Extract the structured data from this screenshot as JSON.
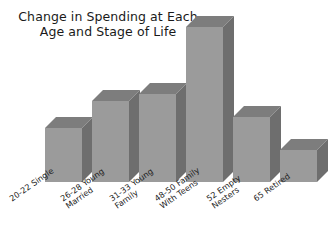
{
  "chart_data": {
    "type": "bar",
    "title": "Change in Spending at Each\nAge and Stage of Life",
    "xlabel": "",
    "ylabel": "",
    "categories": [
      "20-22 Single",
      "26-28 Young\nMarried",
      "31-33 Young\nFamily",
      "48-50 Family\nWith Teens",
      "52 Empty\nNesters",
      "65 Retired"
    ],
    "values": [
      32,
      48,
      52,
      98,
      44,
      19
    ],
    "ylim": [
      0,
      100
    ],
    "grid": false,
    "legend": "none",
    "style": "3d-column",
    "colors": {
      "bar_front": "#9b9b9b",
      "bar_top": "#7d7d7d",
      "bar_side": "#6e6e6e",
      "background": "#ffffff",
      "text": "#1a1a1a"
    }
  },
  "bars": [
    {
      "label": "20-22 Single",
      "left": 45,
      "width": 37,
      "height": 54,
      "depth": 11
    },
    {
      "label": "26-28 Young Married",
      "left": 92,
      "width": 37,
      "height": 81,
      "depth": 11
    },
    {
      "label": "31-33 Young Family",
      "left": 139,
      "width": 37,
      "height": 88,
      "depth": 11
    },
    {
      "label": "48-50 Family With Teens",
      "left": 186,
      "width": 37,
      "height": 155,
      "depth": 11
    },
    {
      "label": "52 Empty Nesters",
      "left": 233,
      "width": 37,
      "height": 65,
      "depth": 11
    },
    {
      "label": "65 Retired",
      "left": 280,
      "width": 37,
      "height": 32,
      "depth": 11
    }
  ],
  "xlabels": [
    {
      "text": "20-22 Single",
      "left": 8,
      "top": 14
    },
    {
      "text": "26-28 Young\nMarried",
      "left": 59,
      "top": 14
    },
    {
      "text": "31-33 Young\nFamily",
      "left": 108,
      "top": 14
    },
    {
      "text": "48-50 Family\nWith Teens",
      "left": 153,
      "top": 14
    },
    {
      "text": "52 Empty\nNesters",
      "left": 205,
      "top": 14
    },
    {
      "text": "65 Retired",
      "left": 252,
      "top": 14
    }
  ]
}
